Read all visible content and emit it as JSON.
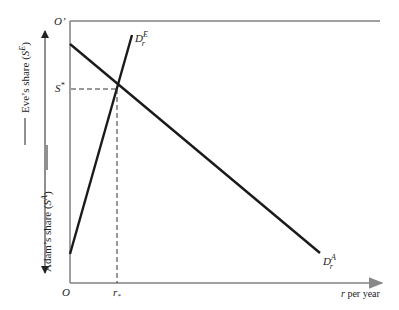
{
  "diagram": {
    "origin_label": "O",
    "top_origin_label": "O'",
    "s_star_label": "S*",
    "r_star_label": "r*",
    "x_axis_label": "r per year",
    "eve_axis_label": "Eve's share (S^E)",
    "adam_axis_label": "Adam's share (S^A)",
    "curve_eve_label": "D_r^E",
    "curve_adam_label": "D_r^A",
    "colors": {
      "curve": "#1a1a1a",
      "axis": "#808080",
      "dashed": "#333333"
    }
  }
}
